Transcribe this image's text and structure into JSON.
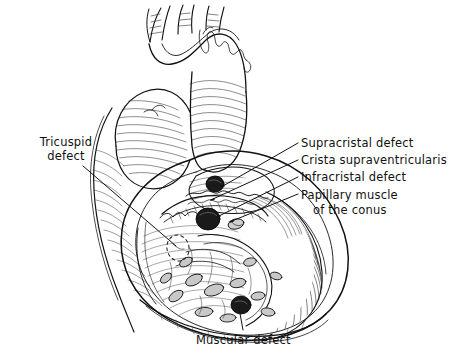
{
  "figure": {
    "kind": "medical-line-illustration",
    "view": "anterior",
    "background_color": "#ffffff",
    "ink_color": "#111111",
    "signature": "artist signature, cursive, upper aorta region"
  },
  "labels": {
    "tricuspid": {
      "line1": "Tricuspid",
      "line2": "defect"
    },
    "supracristal": "Supracristal defect",
    "crista": "Crista supraventricularis",
    "infracristal": "Infracristal defect",
    "papillary": {
      "line1": "Papillary muscle",
      "line2": "of the conus"
    },
    "muscular": "Muscular defect"
  },
  "anatomy_features": [
    {
      "name": "aortic-arch",
      "note": "ascending aorta with three brachiocephalic branches at top"
    },
    {
      "name": "pulmonary-trunk",
      "note": "left of aorta, hatched"
    },
    {
      "name": "right-ventricle-cavity",
      "note": "opened chamber, center, trabeculated"
    },
    {
      "name": "interventricular-septum",
      "note": "septal surface bearing the defects"
    },
    {
      "name": "crista-supraventricularis",
      "note": "muscular ridge separating supracristal and infracristal regions"
    },
    {
      "name": "papillary-muscle-of-conus",
      "note": "small papillary muscle on septum"
    },
    {
      "name": "tricuspid-valve-region",
      "note": "dashed outline, lower left of septum"
    },
    {
      "name": "ventricular-apex",
      "note": "lower heart border"
    }
  ],
  "defects": [
    {
      "name": "supracristal-defect",
      "marker": "filled-dark-oval",
      "cx": 215,
      "cy": 184,
      "rx": 9,
      "ry": 8
    },
    {
      "name": "infracristal-defect",
      "marker": "filled-dark-oval",
      "cx": 208,
      "cy": 219,
      "rx": 12,
      "ry": 11
    },
    {
      "name": "muscular-defect",
      "marker": "filled-dark-oval",
      "cx": 241,
      "cy": 305,
      "rx": 10,
      "ry": 9
    },
    {
      "name": "tricuspid-defect",
      "marker": "dashed-outline",
      "cx": 178,
      "cy": 248,
      "rx": 11,
      "ry": 13
    }
  ],
  "leader_lines": [
    {
      "name": "leader-tricuspid",
      "from": [
        83,
        166
      ],
      "to": [
        176,
        246
      ]
    },
    {
      "name": "leader-supracristal",
      "from": [
        298,
        143
      ],
      "to": [
        223,
        186
      ]
    },
    {
      "name": "leader-crista",
      "from": [
        298,
        160
      ],
      "to": [
        213,
        199
      ]
    },
    {
      "name": "leader-infracristal",
      "from": [
        298,
        177
      ],
      "to": [
        219,
        216
      ]
    },
    {
      "name": "leader-papillary",
      "from": [
        298,
        194
      ],
      "to": [
        232,
        221
      ]
    },
    {
      "name": "leader-muscular",
      "from": [
        243,
        330
      ],
      "to": [
        239,
        308
      ]
    }
  ],
  "colors": {
    "ink": "#111111",
    "paper": "#ffffff",
    "defect_fill": "#1a1a1a",
    "shade_light": "#d8d8d8",
    "shade_mid": "#a9a9a9"
  }
}
